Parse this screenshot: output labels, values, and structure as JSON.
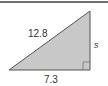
{
  "diagram": {
    "type": "right-triangle",
    "labels": {
      "hypotenuse": "12.8",
      "vertical_side": "s",
      "base": "7.3"
    },
    "colors": {
      "fill": "#c8c8c8",
      "stroke": "#555555",
      "text": "#333333",
      "top_rule": "#6e6e6e"
    }
  }
}
